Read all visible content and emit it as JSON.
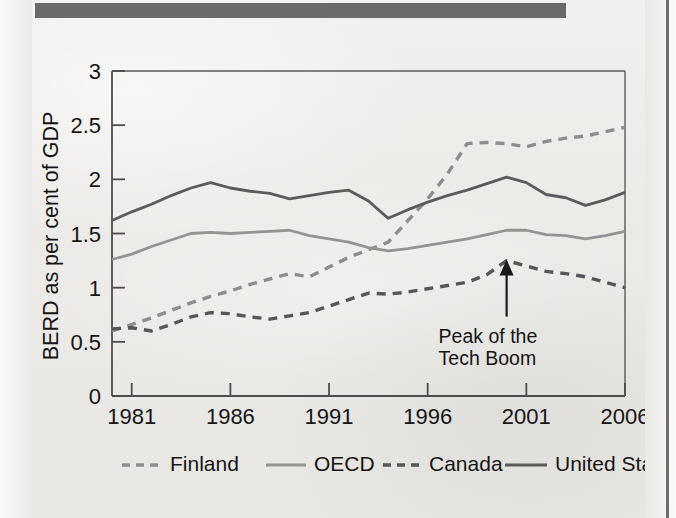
{
  "page": {
    "header_bar_color": "#6a6a6a",
    "paper_color": "#eeecea"
  },
  "chart_data": {
    "type": "line",
    "title": "",
    "subtitle": "",
    "xlabel": "",
    "ylabel": "BERD as per cent of GDP",
    "xlim": [
      1980,
      2006
    ],
    "ylim": [
      0,
      3
    ],
    "ytick_labels": [
      "0",
      "0.5",
      "1",
      "1.5",
      "2",
      "2.5",
      "3"
    ],
    "ytick_values": [
      0,
      0.5,
      1,
      1.5,
      2,
      2.5,
      3
    ],
    "xtick_labels": [
      "1981",
      "1986",
      "1991",
      "1996",
      "2001",
      "2006"
    ],
    "xtick_values": [
      1981,
      1986,
      1991,
      1996,
      2001,
      2006
    ],
    "grid": false,
    "legend_position": "below",
    "x": [
      1980,
      1981,
      1982,
      1983,
      1984,
      1985,
      1986,
      1987,
      1988,
      1989,
      1990,
      1991,
      1992,
      1993,
      1994,
      1995,
      1996,
      1997,
      1998,
      1999,
      2000,
      2001,
      2002,
      2003,
      2004,
      2005,
      2006
    ],
    "series": [
      {
        "name": "Finland",
        "style": "dashed",
        "color": "#8d8d8d",
        "values": [
          0.6,
          0.66,
          0.72,
          0.79,
          0.86,
          0.92,
          0.97,
          1.03,
          1.08,
          1.13,
          1.1,
          1.19,
          1.28,
          1.35,
          1.42,
          1.62,
          1.82,
          2.05,
          2.33,
          2.34,
          2.33,
          2.3,
          2.35,
          2.38,
          2.4,
          2.44,
          2.48
        ]
      },
      {
        "name": "OECD",
        "style": "solid",
        "color": "#949494",
        "values": [
          1.26,
          1.31,
          1.38,
          1.44,
          1.5,
          1.51,
          1.5,
          1.51,
          1.52,
          1.53,
          1.48,
          1.45,
          1.42,
          1.37,
          1.34,
          1.36,
          1.39,
          1.42,
          1.45,
          1.49,
          1.53,
          1.53,
          1.49,
          1.48,
          1.45,
          1.48,
          1.52
        ]
      },
      {
        "name": "Canada",
        "style": "dashed",
        "color": "#565656",
        "values": [
          0.62,
          0.63,
          0.6,
          0.66,
          0.73,
          0.77,
          0.76,
          0.73,
          0.71,
          0.74,
          0.77,
          0.83,
          0.89,
          0.95,
          0.94,
          0.96,
          0.99,
          1.02,
          1.05,
          1.12,
          1.25,
          1.2,
          1.15,
          1.13,
          1.1,
          1.05,
          1.0
        ]
      },
      {
        "name": "United States",
        "style": "solid",
        "color": "#5b5b5b",
        "values": [
          1.62,
          1.7,
          1.77,
          1.85,
          1.92,
          1.97,
          1.92,
          1.89,
          1.87,
          1.82,
          1.85,
          1.88,
          1.9,
          1.8,
          1.64,
          1.72,
          1.79,
          1.85,
          1.9,
          1.96,
          2.02,
          1.97,
          1.86,
          1.83,
          1.76,
          1.81,
          1.88
        ]
      }
    ],
    "annotations": [
      {
        "text_line_1": "Peak of the",
        "text_line_2": "Tech Boom",
        "target_series": "Canada",
        "target_x": 2000,
        "target_y": 1.25,
        "arrow": "up"
      }
    ]
  },
  "legend": {
    "items": [
      {
        "label": "Finland",
        "style": "dashed",
        "color": "#8d8d8d"
      },
      {
        "label": "OECD",
        "style": "solid",
        "color": "#949494"
      },
      {
        "label": "Canada",
        "style": "dashed",
        "color": "#565656"
      },
      {
        "label": "United States",
        "style": "solid",
        "color": "#5b5b5b"
      }
    ]
  }
}
